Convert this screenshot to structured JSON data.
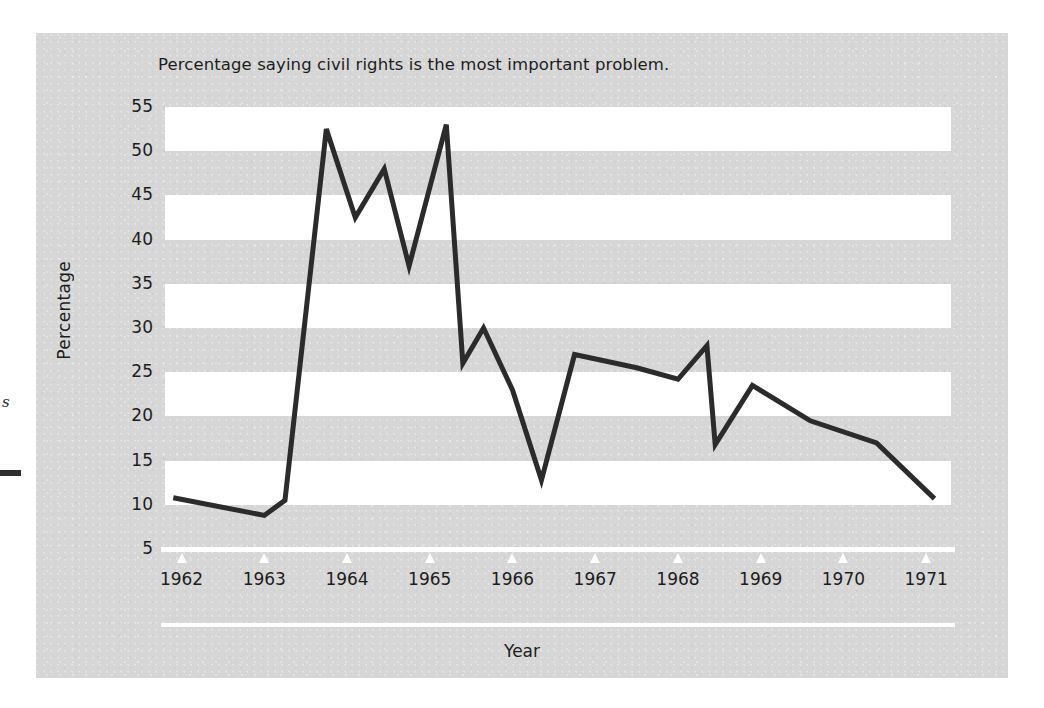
{
  "figure": {
    "title": "Percentage saying civil rights is the most important problem.",
    "x_axis_title": "Year",
    "y_axis_title": "Percentage"
  },
  "page_edge": {
    "fragment_text": "s"
  },
  "colors": {
    "panel_background": "#d6d6d6",
    "band_fill": "#ffffff",
    "line": "#2b2b2b",
    "text": "#1d1d1d",
    "axis": "#ffffff"
  },
  "chart_data": {
    "type": "line",
    "title": "Percentage saying civil rights is the most important problem.",
    "xlabel": "Year",
    "ylabel": "Percentage",
    "xlim": [
      1961.8,
      1971.3
    ],
    "ylim": [
      5,
      55
    ],
    "y_ticks": [
      5,
      10,
      15,
      20,
      25,
      30,
      35,
      40,
      45,
      50,
      55
    ],
    "x_ticks": [
      1962,
      1963,
      1964,
      1965,
      1966,
      1967,
      1968,
      1969,
      1970,
      1971
    ],
    "x_tick_labels": [
      "1962",
      "1963",
      "1964",
      "1965",
      "1966",
      "1967",
      "1968",
      "1969",
      "1970",
      "1971"
    ],
    "grid": "horizontal alternating white bands spanning 55-50, 45-40, 35-30, 25-20, 15-10",
    "legend": null,
    "series": [
      {
        "name": "Civil rights most important problem",
        "x": [
          1961.9,
          1963.0,
          1963.25,
          1963.75,
          1964.1,
          1964.45,
          1964.75,
          1965.2,
          1965.4,
          1965.65,
          1966.0,
          1966.35,
          1966.75,
          1967.5,
          1968.0,
          1968.35,
          1968.45,
          1968.9,
          1969.6,
          1970.4,
          1971.1
        ],
        "y": [
          10.8,
          8.8,
          10.5,
          52.5,
          42.5,
          48.0,
          37.0,
          53.0,
          26.0,
          30.0,
          23.0,
          12.8,
          27.0,
          25.5,
          24.2,
          28.0,
          16.8,
          23.5,
          19.5,
          17.0,
          10.7
        ]
      }
    ]
  }
}
